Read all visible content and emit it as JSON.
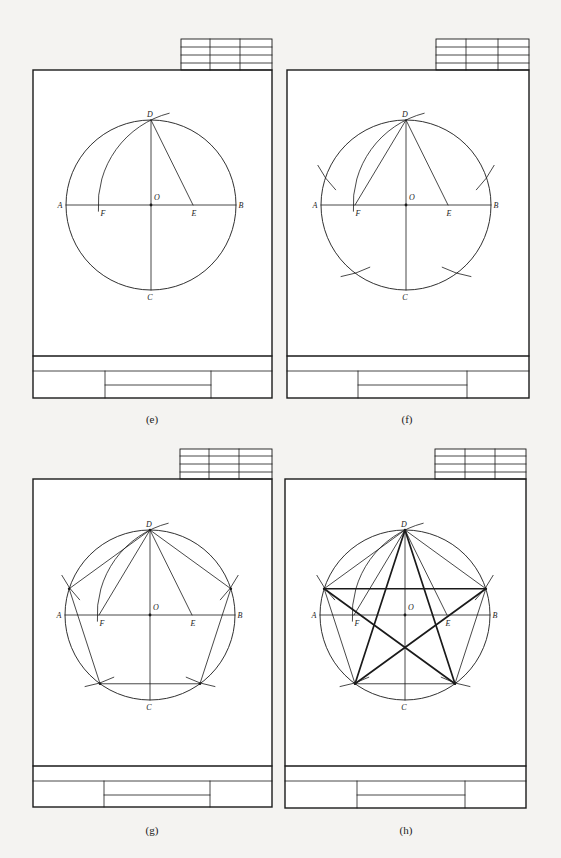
{
  "figure": {
    "colors": {
      "background": "#f4f3f1",
      "ink": "#1a1a1a",
      "sheet": "#ffffff"
    },
    "point_labels": [
      "A",
      "B",
      "C",
      "D",
      "E",
      "F",
      "O"
    ],
    "panels": [
      {
        "id": "e",
        "caption": "(e)",
        "frame": {
          "x": 33,
          "y": 70,
          "w": 239,
          "h": 328
        },
        "corner_table": {
          "x": 181,
          "y": 39,
          "w": 91,
          "h": 31,
          "cols": [
            210,
            240
          ],
          "rows": [
            47,
            55,
            63
          ]
        },
        "title_block": {
          "y1": 356,
          "y2": 371,
          "div1": 105,
          "div2": 211,
          "inner_y": 385
        },
        "circle": {
          "cx": 151,
          "cy": 205,
          "r": 85
        },
        "E_x": 193,
        "F_x": 100,
        "step": "Draw arc centered E radius ED to locate F",
        "caption_pos": {
          "x": 152,
          "y": 423
        }
      },
      {
        "id": "f",
        "caption": "(f)",
        "frame": {
          "x": 287,
          "y": 70,
          "w": 242,
          "h": 328
        },
        "corner_table": {
          "x": 436,
          "y": 39,
          "w": 93,
          "h": 31,
          "cols": [
            466,
            498
          ],
          "rows": [
            47,
            55,
            63
          ]
        },
        "title_block": {
          "y1": 356,
          "y2": 371,
          "div1": 358,
          "div2": 467,
          "inner_y": 385
        },
        "circle": {
          "cx": 406,
          "cy": 205,
          "r": 85
        },
        "E_x": 448,
        "F_x": 355,
        "step": "DF is side length; step off arcs around circle",
        "caption_pos": {
          "x": 407,
          "y": 423
        }
      },
      {
        "id": "g",
        "caption": "(g)",
        "frame": {
          "x": 33,
          "y": 479,
          "w": 239,
          "h": 328
        },
        "corner_table": {
          "x": 180,
          "y": 449,
          "w": 92,
          "h": 30,
          "cols": [
            209,
            239
          ],
          "rows": [
            456,
            464,
            472
          ]
        },
        "title_block": {
          "y1": 766,
          "y2": 781,
          "div1": 104,
          "div2": 210,
          "inner_y": 795
        },
        "circle": {
          "cx": 150,
          "cy": 615,
          "r": 85
        },
        "E_x": 192,
        "F_x": 99,
        "step": "Connect division points to form regular pentagon",
        "caption_pos": {
          "x": 152,
          "y": 834
        }
      },
      {
        "id": "h",
        "caption": "(h)",
        "frame": {
          "x": 285,
          "y": 479,
          "w": 241,
          "h": 329
        },
        "corner_table": {
          "x": 435,
          "y": 449,
          "w": 91,
          "h": 30,
          "cols": [
            465,
            495
          ],
          "rows": [
            456,
            464,
            472
          ]
        },
        "title_block": {
          "y1": 766,
          "y2": 781,
          "div1": 357,
          "div2": 465,
          "inner_y": 795
        },
        "circle": {
          "cx": 405,
          "cy": 615,
          "r": 85
        },
        "E_x": 447,
        "F_x": 354,
        "step": "Connect alternate vertices to form five-pointed star",
        "caption_pos": {
          "x": 406,
          "y": 834
        }
      }
    ]
  }
}
